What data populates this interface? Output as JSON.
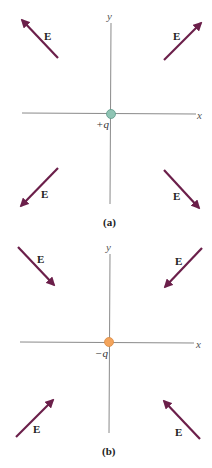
{
  "colors": {
    "arrow": "#6b1f4a",
    "axis": "#8a8a8a",
    "positive_charge": "#8fc4b4",
    "negative_charge": "#f3a45c"
  },
  "panels": [
    {
      "caption": "(a)",
      "charge_label": "+q",
      "x_label": "x",
      "y_label": "y",
      "field_label": "E",
      "direction": "outward"
    },
    {
      "caption": "(b)",
      "charge_label": "−q",
      "x_label": "x",
      "y_label": "y",
      "field_label": "E",
      "direction": "inward"
    }
  ]
}
